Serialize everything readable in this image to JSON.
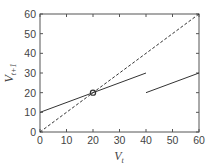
{
  "chart_data": {
    "type": "line",
    "title": "",
    "xlabel": "V_t",
    "ylabel": "V_{t+1}",
    "xlim": [
      0,
      60
    ],
    "ylim": [
      0,
      60
    ],
    "grid": false,
    "legend": null,
    "x_ticks": [
      0,
      10,
      20,
      30,
      40,
      50,
      60
    ],
    "y_ticks": [
      0,
      10,
      20,
      30,
      40,
      50,
      60
    ],
    "series": [
      {
        "name": "identity line (V_{t+1} = V_t)",
        "style": "dashed",
        "color": "#333333",
        "x": [
          0,
          60
        ],
        "y": [
          0,
          60
        ]
      },
      {
        "name": "map branch 1",
        "style": "solid",
        "color": "#333333",
        "x": [
          0,
          40
        ],
        "y": [
          10,
          30
        ]
      },
      {
        "name": "map branch 2",
        "style": "solid",
        "color": "#333333",
        "x": [
          40,
          60
        ],
        "y": [
          20,
          30
        ]
      }
    ],
    "annotations": [
      {
        "type": "open-circle",
        "label": "fixed point",
        "x": 20,
        "y": 20
      }
    ]
  },
  "axes": {
    "xlabel_main": "V",
    "xlabel_sub": "t",
    "ylabel_main": "V",
    "ylabel_sub": "t+1"
  }
}
